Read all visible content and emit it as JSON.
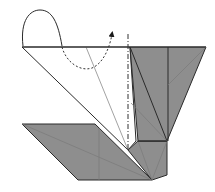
{
  "diagram": {
    "type": "origami-fold-step",
    "colors": {
      "paper_white": "#ffffff",
      "paper_colored": "#8e8e8e",
      "line": "#2a2a2a",
      "crease": "#7a7a7a"
    },
    "symbols": [
      {
        "name": "mountain-fold-line",
        "style": "dash-dot",
        "orientation": "vertical"
      },
      {
        "name": "fold-behind-arrow",
        "style": "dotted curve with filled arrowhead"
      },
      {
        "name": "loop-curve",
        "style": "solid rounded loop above top edge"
      }
    ],
    "labels": []
  }
}
